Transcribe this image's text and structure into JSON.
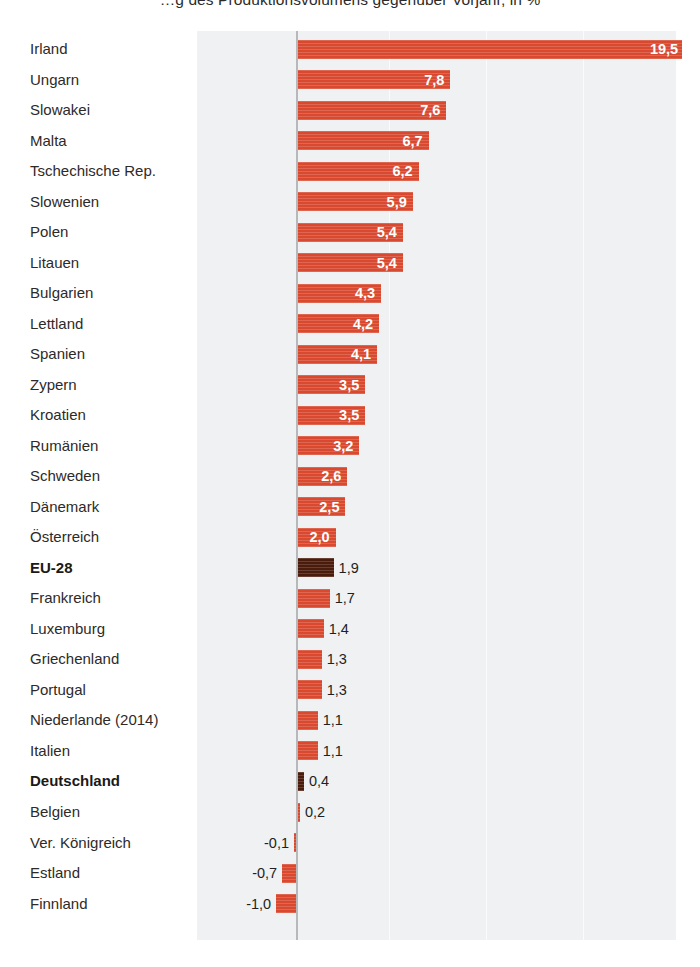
{
  "title": "…g des Produktionsvolumens gegenüber Vorjahr, in %",
  "colors": {
    "bar": "#d9492f",
    "bar_highlight": "#4a1c0c",
    "plot_background": "#f0f1f3",
    "gridline": "#fbfbfc",
    "axis": "#b6b8ba",
    "label_text": "#2e2a28",
    "value_inside": "#ffffff",
    "value_outside": "#231f20"
  },
  "chart_data": {
    "type": "bar",
    "orientation": "horizontal",
    "title": "…g des Produktionsvolumens gegenüber Vorjahr, in %",
    "xlabel": "",
    "ylabel": "",
    "xlim": [
      -1.5,
      20.2
    ],
    "grid": true,
    "gridlines": [
      4.7,
      9.6,
      14.5
    ],
    "legend": null,
    "value_format": "de-DE, comma decimal separator",
    "units": "%",
    "categories": [
      "Irland",
      "Ungarn",
      "Slowakei",
      "Malta",
      "Tschechische Rep.",
      "Slowenien",
      "Polen",
      "Litauen",
      "Bulgarien",
      "Lettland",
      "Spanien",
      "Zypern",
      "Kroatien",
      "Rumänien",
      "Schweden",
      "Dänemark",
      "Österreich",
      "EU-28",
      "Frankreich",
      "Luxemburg",
      "Griechenland",
      "Portugal",
      "Niederlande (2014)",
      "Italien",
      "Deutschland",
      "Belgien",
      "Ver. Königreich",
      "Estland",
      "Finnland"
    ],
    "values": [
      19.5,
      7.8,
      7.6,
      6.7,
      6.2,
      5.9,
      5.4,
      5.4,
      4.3,
      4.2,
      4.1,
      3.5,
      3.5,
      3.2,
      2.6,
      2.5,
      2.0,
      1.9,
      1.7,
      1.4,
      1.3,
      1.3,
      1.1,
      1.1,
      0.4,
      0.2,
      -0.1,
      -0.7,
      -1.0
    ],
    "value_labels": [
      "19,5",
      "7,8",
      "7,6",
      "6,7",
      "6,2",
      "5,9",
      "5,4",
      "5,4",
      "4,3",
      "4,2",
      "4,1",
      "3,5",
      "3,5",
      "3,2",
      "2,6",
      "2,5",
      "2,0",
      "1,9",
      "1,7",
      "1,4",
      "1,3",
      "1,3",
      "1,1",
      "1,1",
      "0,4",
      "0,2",
      "-0,1",
      "-0,7",
      "-1,0"
    ],
    "highlighted": [
      "EU-28",
      "Deutschland"
    ],
    "bold_labels": [
      "EU-28",
      "Deutschland"
    ]
  }
}
